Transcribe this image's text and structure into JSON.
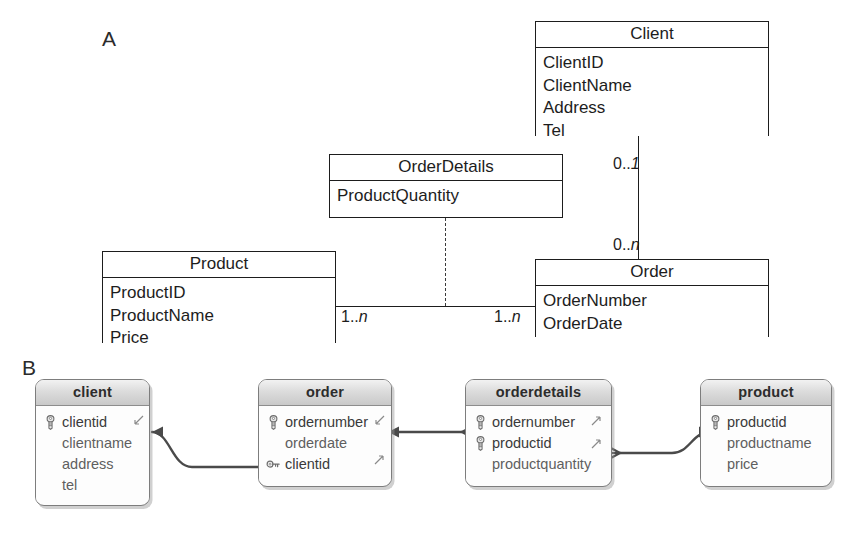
{
  "figure": {
    "panels": [
      {
        "id": "A",
        "label": "A",
        "caption": "UML class diagram"
      },
      {
        "id": "B",
        "label": "B",
        "caption": "Relational schema relationships"
      }
    ]
  },
  "panel_a": {
    "label": "A",
    "notation": "UML",
    "classes": [
      {
        "name": "Client",
        "title": "Client",
        "attributes": [
          "ClientID",
          "ClientName",
          "Address",
          "Tel"
        ]
      },
      {
        "name": "OrderDetails",
        "title": "OrderDetails",
        "attributes": [
          "ProductQuantity"
        ]
      },
      {
        "name": "Product",
        "title": "Product",
        "attributes": [
          "ProductID",
          "ProductName",
          "Price"
        ]
      },
      {
        "name": "Order",
        "title": "Order",
        "attributes": [
          "OrderNumber",
          "OrderDate"
        ]
      }
    ],
    "associations": [
      {
        "from": "Client",
        "to": "Order",
        "style": "solid",
        "from_multiplicity": "0..1",
        "to_multiplicity": "0..n"
      },
      {
        "from": "Product",
        "to": "Order",
        "style": "solid",
        "from_multiplicity": "1..n",
        "to_multiplicity": "1..n"
      },
      {
        "from": "OrderDetails",
        "to": "Product-Order association",
        "style": "dashed",
        "from_multiplicity": "",
        "to_multiplicity": ""
      }
    ],
    "multiplicities": {
      "client_end": "0..1",
      "order_end_top": "0..n",
      "product_end": "1..n",
      "order_end_bottom": "1..n"
    },
    "multiplicity_parts": {
      "client_end": {
        "prefix": "0..",
        "italic": "1"
      },
      "order_end_top": {
        "prefix": "0..",
        "italic": "n"
      },
      "product_end": {
        "prefix": "1..",
        "italic": "n"
      },
      "order_end_bottom": {
        "prefix": "1..",
        "italic": "n"
      }
    }
  },
  "panel_b": {
    "label": "B",
    "tables": [
      {
        "name": "client",
        "title": "client",
        "fields": [
          {
            "name": "clientid",
            "key": "primary-key-icon"
          },
          {
            "name": "clientname",
            "key": "none"
          },
          {
            "name": "address",
            "key": "none"
          },
          {
            "name": "tel",
            "key": "none"
          }
        ]
      },
      {
        "name": "order",
        "title": "order",
        "fields": [
          {
            "name": "ordernumber",
            "key": "primary-key-icon"
          },
          {
            "name": "orderdate",
            "key": "none"
          },
          {
            "name": "clientid",
            "key": "foreign-key-icon"
          }
        ]
      },
      {
        "name": "orderdetails",
        "title": "orderdetails",
        "fields": [
          {
            "name": "ordernumber",
            "key": "primary-key-icon"
          },
          {
            "name": "productid",
            "key": "primary-key-icon"
          },
          {
            "name": "productquantity",
            "key": "none"
          }
        ]
      },
      {
        "name": "product",
        "title": "product",
        "fields": [
          {
            "name": "productid",
            "key": "primary-key-icon"
          },
          {
            "name": "productname",
            "key": "none"
          },
          {
            "name": "price",
            "key": "none"
          }
        ]
      }
    ],
    "relationships": [
      {
        "from_table": "order",
        "from_field": "clientid",
        "to_table": "client",
        "to_field": "clientid",
        "type": "many-to-one"
      },
      {
        "from_table": "orderdetails",
        "from_field": "ordernumber",
        "to_table": "order",
        "to_field": "ordernumber",
        "type": "many-to-one"
      },
      {
        "from_table": "orderdetails",
        "from_field": "productid",
        "to_table": "product",
        "to_field": "productid",
        "type": "many-to-one"
      }
    ]
  },
  "colors": {
    "line": "#1d1d1d",
    "connector": "#4a4a4a",
    "table_border": "#7d7d7d",
    "header_gradient_top": "#f2f2f2",
    "header_gradient_bottom": "#c9c9c9",
    "field_text": "#5f5f5f",
    "title_text": "#2c2c2c"
  }
}
